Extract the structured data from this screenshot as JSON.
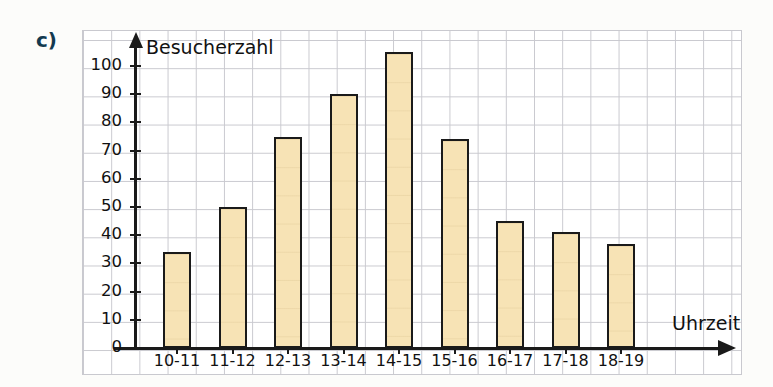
{
  "exercise": {
    "label": "c)",
    "label_color": "#12394f"
  },
  "chart_data": {
    "type": "bar",
    "title": "",
    "xlabel": "Uhrzeit",
    "ylabel": "Besucherzahl",
    "categories": [
      "10-11",
      "11-12",
      "12-13",
      "13-14",
      "14-15",
      "15-16",
      "16-17",
      "17-18",
      "18-19"
    ],
    "values": [
      34,
      50,
      75,
      90,
      105,
      74,
      45,
      41,
      37
    ],
    "ylim": [
      0,
      110
    ],
    "ytick_labels": [
      "0",
      "10",
      "20",
      "30",
      "40",
      "50",
      "60",
      "70",
      "80",
      "90",
      "100"
    ],
    "ytick_values": [
      0,
      10,
      20,
      30,
      40,
      50,
      60,
      70,
      80,
      90,
      100
    ],
    "grid": true,
    "legend": "none",
    "bar_fill_color": "#f7e3b5",
    "bar_edge_color": "#1a1a1a",
    "grid_color": "#c9c9cf",
    "axis_color": "#1a1a1a"
  }
}
